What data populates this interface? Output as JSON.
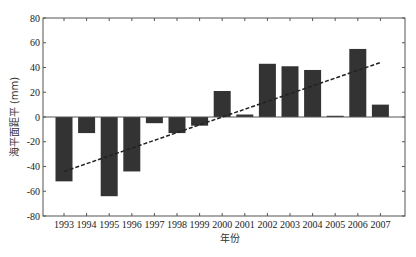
{
  "chart_data": {
    "type": "bar",
    "title": "",
    "xlabel": "年份",
    "ylabel": "海平面距平 (mm)",
    "categories": [
      "1993",
      "1994",
      "1995",
      "1996",
      "1997",
      "1998",
      "1999",
      "2000",
      "2001",
      "2002",
      "2003",
      "2004",
      "2005",
      "2006",
      "2007"
    ],
    "values": [
      -52,
      -13,
      -64,
      -44,
      -5,
      -13,
      -7,
      21,
      2,
      43,
      41,
      38,
      1,
      55,
      10
    ],
    "ylim": [
      -80,
      80
    ],
    "yticks": [
      80,
      60,
      40,
      20,
      0,
      -20,
      -40,
      -60,
      -80
    ],
    "grid": false,
    "bar_color": "#333333",
    "trend_line": {
      "style": "dashed",
      "color": "#222222",
      "start": {
        "x": "1993",
        "y": -44
      },
      "end": {
        "x": "2007",
        "y": 44
      }
    }
  }
}
